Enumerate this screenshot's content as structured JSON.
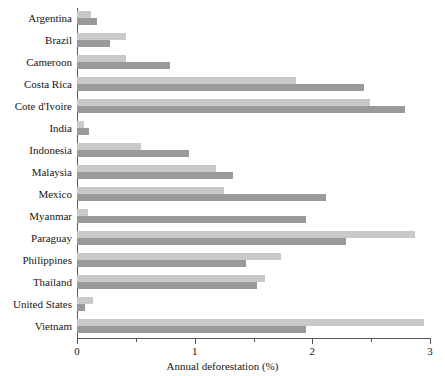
{
  "chart_data": {
    "type": "bar",
    "orientation": "horizontal",
    "title": "",
    "xlabel": "Annual deforestation (%)",
    "ylabel": "",
    "xlim": [
      0,
      3
    ],
    "xticks": [
      0,
      1,
      2,
      3
    ],
    "xtick_labels": [
      "0",
      "1",
      "2",
      "3"
    ],
    "xminor_ticks": [
      0.5,
      1.5,
      2.5
    ],
    "grid": false,
    "legend": "none",
    "categories": [
      "Argentina",
      "Brazil",
      "Cameroon",
      "Costa Rica",
      "Cote d'Ivoire",
      "India",
      "Indonesia",
      "Malaysia",
      "Mexico",
      "Myanmar",
      "Paraguay",
      "Philippines",
      "Thailand",
      "United States",
      "Vietnam"
    ],
    "series": [
      {
        "name": "light",
        "color": "#c9c9c9",
        "values": [
          0.12,
          0.42,
          0.42,
          1.86,
          2.49,
          0.06,
          0.54,
          1.18,
          1.25,
          0.09,
          2.87,
          1.73,
          1.6,
          0.14,
          2.95
        ]
      },
      {
        "name": "dark",
        "color": "#9a9a9a",
        "values": [
          0.17,
          0.28,
          0.79,
          2.44,
          2.79,
          0.1,
          0.95,
          1.33,
          2.12,
          1.95,
          2.29,
          1.44,
          1.53,
          0.07,
          1.95
        ]
      }
    ]
  },
  "colors": {
    "light_bar": "#c9c9c9",
    "dark_bar": "#9a9a9a",
    "axis": "#555555",
    "text": "#161616",
    "background": "#ffffff"
  }
}
